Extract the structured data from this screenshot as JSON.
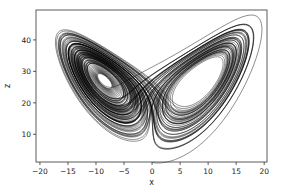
{
  "chart_data": {
    "type": "line",
    "title": "",
    "xlabel": "x",
    "ylabel": "z",
    "xlim": [
      -20.7,
      20.5
    ],
    "ylim": [
      1.2,
      49.5
    ],
    "xticks": [
      -20,
      -15,
      -10,
      -5,
      0,
      5,
      10,
      15,
      20
    ],
    "xtick_labels": [
      "−20",
      "−15",
      "−10",
      "−5",
      "0",
      "5",
      "10",
      "15",
      "20"
    ],
    "yticks": [
      10,
      20,
      30,
      40
    ],
    "ytick_labels": [
      "10",
      "20",
      "30",
      "40"
    ],
    "grid": false,
    "legend": null,
    "series": [
      {
        "name": "lorenz",
        "color": "#000000",
        "params": {
          "sigma": 10,
          "rho": 28,
          "beta": 2.6667
        },
        "initial": [
          0.0,
          1.0,
          1.05
        ],
        "dt": 0.005,
        "steps": 20000
      }
    ]
  },
  "frame": {
    "left": 36,
    "right": 267,
    "top": 10,
    "bottom": 162,
    "color": "#333333"
  }
}
